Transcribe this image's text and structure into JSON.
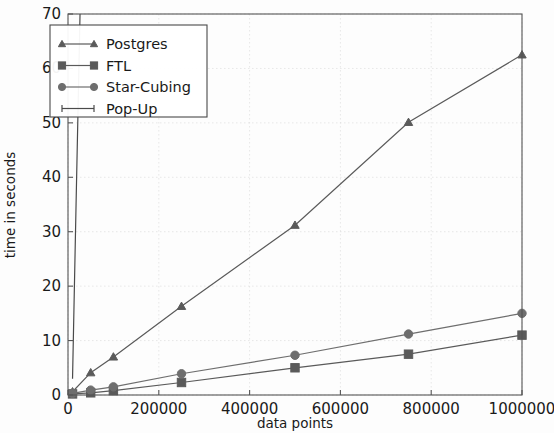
{
  "chart_data": {
    "type": "line",
    "title": "",
    "xlabel": "data points",
    "ylabel": "time in seconds",
    "xlim": [
      0,
      1000000
    ],
    "ylim": [
      0,
      70
    ],
    "xticks": [
      0,
      200000,
      400000,
      600000,
      800000,
      1000000
    ],
    "xtick_labels": [
      "0",
      "200000",
      "400000",
      "600000",
      "800000",
      "1000000"
    ],
    "yticks": [
      0,
      10,
      20,
      30,
      40,
      50,
      60,
      70
    ],
    "ytick_labels": [
      "0",
      "10",
      "20",
      "30",
      "40",
      "50",
      "60",
      "70"
    ],
    "grid": true,
    "legend_position": "upper left",
    "series": [
      {
        "name": "Postgres",
        "marker": "triangle",
        "color": "#5a5a5a",
        "x": [
          10000,
          50000,
          100000,
          250000,
          500000,
          750000,
          1000000
        ],
        "y": [
          0.6,
          4.1,
          7.0,
          16.3,
          31.2,
          50.1,
          62.5
        ]
      },
      {
        "name": "FTL",
        "marker": "square",
        "color": "#5a5a5a",
        "x": [
          10000,
          50000,
          100000,
          250000,
          500000,
          750000,
          1000000
        ],
        "y": [
          0.2,
          0.4,
          0.8,
          2.3,
          5.0,
          7.5,
          11.0
        ]
      },
      {
        "name": "Star-Cubing",
        "marker": "circle",
        "color": "#6e6e6e",
        "x": [
          10000,
          50000,
          100000,
          250000,
          500000,
          750000,
          1000000
        ],
        "y": [
          0.3,
          0.9,
          1.5,
          3.9,
          7.3,
          11.2,
          15.0
        ]
      },
      {
        "name": "Pop-Up",
        "marker": "none",
        "color": "#4a4a4a",
        "x": [
          10000,
          18000,
          26500
        ],
        "y": [
          3.0,
          36.0,
          70.0
        ]
      }
    ]
  },
  "legend": {
    "entries": [
      {
        "label": "Postgres",
        "marker": "triangle"
      },
      {
        "label": "FTL",
        "marker": "square"
      },
      {
        "label": "Star-Cubing",
        "marker": "circle"
      },
      {
        "label": "Pop-Up",
        "marker": "none"
      }
    ]
  }
}
